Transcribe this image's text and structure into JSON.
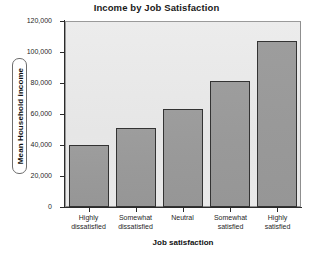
{
  "chart_data": {
    "type": "bar",
    "title": "Income by Job Satisfaction",
    "xlabel": "Job satisfaction",
    "ylabel": "Mean Household income",
    "categories": [
      "Highly\ndissatisfied",
      "Somewhat\ndissatisfied",
      "Neutral",
      "Somewhat\nsatisfied",
      "Highly\nsatisfied"
    ],
    "category_lines": [
      [
        "Highly",
        "dissatisfied"
      ],
      [
        "Somewhat",
        "dissatisfied"
      ],
      [
        "Neutral",
        ""
      ],
      [
        "Somewhat",
        "satisfied"
      ],
      [
        "Highly",
        "satisfied"
      ]
    ],
    "values": [
      40000,
      51000,
      63000,
      81500,
      107000
    ],
    "ylim": [
      0,
      120000
    ],
    "ytick_values": [
      0,
      20000,
      40000,
      60000,
      80000,
      100000,
      120000
    ],
    "ytick_labels": [
      "0",
      "20,000",
      "40,000",
      "60,000",
      "80,000",
      "100,000",
      "120,000"
    ],
    "grid": false,
    "legend": false,
    "bar_fill_color": "#999999",
    "bar_border_color": "#333333",
    "plot_background_color": "#e8e8e8",
    "axis_color": "#2b2b2b",
    "figure_background_color": "#ffffff"
  }
}
